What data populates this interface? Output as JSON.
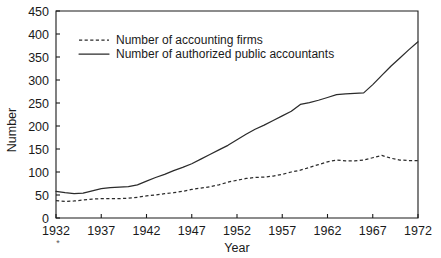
{
  "chart_data": {
    "type": "line",
    "title": "",
    "xlabel": "Year",
    "ylabel": "Number",
    "xlim": [
      1932,
      1972
    ],
    "ylim": [
      0,
      450
    ],
    "grid": false,
    "legend_position": "upper-left-inside",
    "x_ticks": [
      1932,
      1937,
      1942,
      1947,
      1952,
      1957,
      1962,
      1967,
      1972
    ],
    "x_tick_labels": [
      "1932",
      "1937",
      "1942",
      "1947",
      "1952",
      "1957",
      "1962",
      "1967",
      "1972"
    ],
    "y_ticks": [
      0,
      50,
      100,
      150,
      200,
      250,
      300,
      350,
      400,
      450
    ],
    "y_tick_labels": [
      "0",
      "50",
      "100",
      "150",
      "200",
      "250",
      "300",
      "350",
      "400",
      "450"
    ],
    "footnote_marker": "*",
    "x": [
      1932,
      1933,
      1934,
      1935,
      1936,
      1937,
      1938,
      1939,
      1940,
      1941,
      1942,
      1943,
      1944,
      1945,
      1946,
      1947,
      1948,
      1949,
      1950,
      1951,
      1952,
      1953,
      1954,
      1955,
      1956,
      1957,
      1958,
      1959,
      1960,
      1961,
      1962,
      1963,
      1964,
      1965,
      1966,
      1967,
      1968,
      1969,
      1970,
      1971,
      1972
    ],
    "series": [
      {
        "name": "Number of accounting firms",
        "style": "dashed",
        "color": "#2b2b2b",
        "values": [
          38,
          36,
          37,
          39,
          41,
          42,
          42,
          42,
          43,
          45,
          48,
          50,
          53,
          55,
          58,
          62,
          65,
          68,
          72,
          78,
          82,
          86,
          88,
          89,
          91,
          95,
          100,
          104,
          110,
          116,
          122,
          126,
          124,
          124,
          126,
          131,
          136,
          130,
          126,
          125,
          125
        ]
      },
      {
        "name": "Number of authorized public accountants",
        "style": "solid",
        "color": "#2b2b2b",
        "values": [
          58,
          55,
          53,
          54,
          59,
          64,
          66,
          67,
          68,
          72,
          80,
          88,
          95,
          103,
          110,
          118,
          128,
          138,
          148,
          158,
          170,
          182,
          193,
          202,
          212,
          222,
          232,
          247,
          251,
          256,
          262,
          268,
          270,
          271,
          272,
          290,
          310,
          330,
          348,
          366,
          383
        ]
      }
    ]
  }
}
